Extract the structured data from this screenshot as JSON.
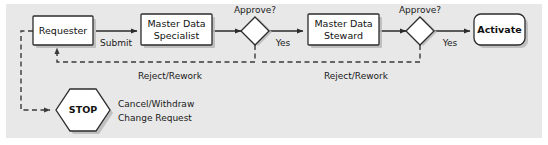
{
  "diagram": {
    "type": "flowchart",
    "background_color": "#e8e8e8",
    "shape_fill_color": "#ffffff",
    "stroke_color": "#2b2b2b",
    "nodes": {
      "requester": {
        "label": "Requester",
        "shape": "rectangle"
      },
      "specialist": {
        "label_line1": "Master Data",
        "label_line2": "Specialist",
        "shape": "rectangle"
      },
      "decision1": {
        "label": "Approve?",
        "shape": "diamond"
      },
      "steward": {
        "label_line1": "Master Data",
        "label_line2": "Steward",
        "shape": "rectangle"
      },
      "decision2": {
        "label": "Approve?",
        "shape": "diamond"
      },
      "activate": {
        "label": "Activate",
        "shape": "rounded-rectangle"
      },
      "stop": {
        "label": "STOP",
        "shape": "hexagon"
      }
    },
    "edges": {
      "submit": {
        "label": "Submit",
        "style": "solid"
      },
      "yes1": {
        "label": "Yes",
        "style": "solid"
      },
      "yes2": {
        "label": "Yes",
        "style": "solid"
      },
      "reject1": {
        "label": "Reject/Rework",
        "style": "dashed"
      },
      "reject2": {
        "label": "Reject/Rework",
        "style": "dashed"
      },
      "cancel": {
        "label_line1": "Cancel/Withdraw",
        "label_line2": "Change Request",
        "style": "dashed"
      }
    }
  }
}
